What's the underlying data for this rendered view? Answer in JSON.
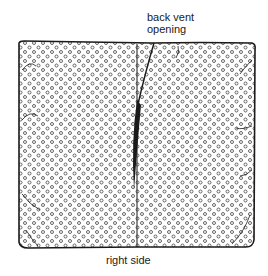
{
  "figure": {
    "labels": {
      "top_line1": "back vent",
      "top_line2": "opening",
      "bottom": "right side"
    },
    "colors": {
      "ink": "#1a1a1a",
      "paper": "#ffffff",
      "dots": "#555555"
    }
  }
}
